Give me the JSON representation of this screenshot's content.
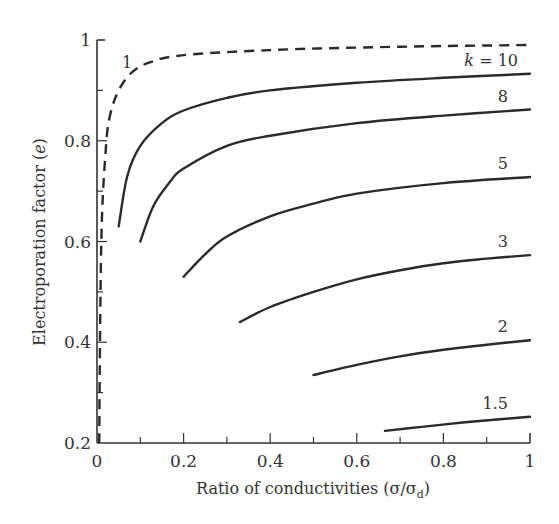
{
  "chart_data": {
    "type": "line",
    "title": "",
    "xlabel": "Ratio of conductivities (σ/σd)",
    "xlabel_main": "Ratio of conductivities (σ/σ",
    "xlabel_sub": "d",
    "xlabel_close": ")",
    "ylabel": "Electroporation factor (e)",
    "ylabel_main": "Electroporation factor (",
    "ylabel_var": "e",
    "ylabel_close": ")",
    "xlim": [
      0,
      1
    ],
    "ylim": [
      0.2,
      1
    ],
    "grid": false,
    "legend_position": "inline curve labels",
    "x_ticks": [
      "0",
      "0.2",
      "0.4",
      "0.6",
      "0.8",
      "1"
    ],
    "y_ticks": [
      "0.2",
      "0.4",
      "0.6",
      "0.8",
      "1"
    ],
    "series": [
      {
        "name": "1",
        "label": "1",
        "style": "dashed",
        "x": [
          0.005,
          0.01,
          0.02,
          0.03,
          0.05,
          0.08,
          0.12,
          0.2,
          0.4,
          0.6,
          0.8,
          1.0
        ],
        "y": [
          0.2,
          0.6,
          0.78,
          0.85,
          0.9,
          0.935,
          0.955,
          0.97,
          0.98,
          0.985,
          0.988,
          0.99
        ]
      },
      {
        "name": "k = 10",
        "label": "k = 10",
        "style": "solid",
        "x": [
          0.05,
          0.07,
          0.1,
          0.15,
          0.2,
          0.3,
          0.4,
          0.6,
          0.8,
          1.0
        ],
        "y": [
          0.63,
          0.73,
          0.79,
          0.835,
          0.86,
          0.885,
          0.9,
          0.915,
          0.925,
          0.933
        ]
      },
      {
        "name": "8",
        "label": "8",
        "style": "solid",
        "x": [
          0.1,
          0.13,
          0.17,
          0.2,
          0.3,
          0.4,
          0.6,
          0.8,
          1.0
        ],
        "y": [
          0.6,
          0.67,
          0.72,
          0.745,
          0.79,
          0.81,
          0.835,
          0.85,
          0.862
        ]
      },
      {
        "name": "5",
        "label": "5",
        "style": "solid",
        "x": [
          0.2,
          0.25,
          0.3,
          0.4,
          0.5,
          0.6,
          0.8,
          1.0
        ],
        "y": [
          0.53,
          0.575,
          0.61,
          0.65,
          0.675,
          0.695,
          0.716,
          0.728
        ]
      },
      {
        "name": "3",
        "label": "3",
        "style": "solid",
        "x": [
          0.33,
          0.4,
          0.5,
          0.6,
          0.7,
          0.8,
          0.9,
          1.0
        ],
        "y": [
          0.44,
          0.47,
          0.5,
          0.525,
          0.543,
          0.557,
          0.566,
          0.573
        ]
      },
      {
        "name": "2",
        "label": "2",
        "style": "solid",
        "x": [
          0.5,
          0.6,
          0.7,
          0.8,
          0.9,
          1.0
        ],
        "y": [
          0.335,
          0.355,
          0.372,
          0.385,
          0.395,
          0.404
        ]
      },
      {
        "name": "1.5",
        "label": "1.5",
        "style": "solid",
        "x": [
          0.665,
          0.75,
          0.85,
          0.93,
          1.0
        ],
        "y": [
          0.224,
          0.232,
          0.241,
          0.247,
          0.252
        ]
      }
    ]
  }
}
